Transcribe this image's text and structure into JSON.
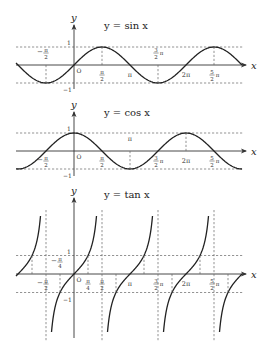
{
  "figure": {
    "width": 272,
    "height": 358,
    "unit_px_per_half_pi": 28,
    "colors": {
      "curve": "#222222",
      "axis": "#333333",
      "dash": "#666666",
      "background": "#ffffff"
    }
  },
  "plots": [
    {
      "id": "sin",
      "title": "y = sin x",
      "function": "sin",
      "origin": {
        "x": 74,
        "y": 65
      },
      "amplitude_px": 18,
      "x_axis": {
        "from": 16,
        "to": 246,
        "label": "x"
      },
      "y_axis": {
        "from": 89,
        "to": 25,
        "label": "y"
      },
      "dash_levels": [
        1,
        -1
      ],
      "y_ticks": [
        {
          "value": 1,
          "label": "1"
        },
        {
          "value": -1,
          "label": "−1"
        }
      ],
      "origin_label": "O",
      "x_ticks": [
        {
          "k": -1,
          "num": "π",
          "den": "2",
          "sign": "−",
          "pos": "above"
        },
        {
          "k": 1,
          "num": "π",
          "den": "2",
          "sign": "",
          "pos": "below"
        },
        {
          "k": 2,
          "text": "π",
          "pos": "below"
        },
        {
          "k": 3,
          "num": "3",
          "den": "2",
          "suffix": "π",
          "pos": "above"
        },
        {
          "k": 4,
          "text": "2π",
          "pos": "below"
        },
        {
          "k": 5,
          "num": "5",
          "den": "2",
          "suffix": "π",
          "pos": "below"
        }
      ],
      "guide_lines_at_k": [
        -1,
        1,
        3,
        5
      ]
    },
    {
      "id": "cos",
      "title": "y = cos x",
      "function": "cos",
      "origin": {
        "x": 74,
        "y": 151
      },
      "amplitude_px": 18,
      "x_axis": {
        "from": 16,
        "to": 246,
        "label": "x"
      },
      "y_axis": {
        "from": 176,
        "to": 112,
        "label": "y"
      },
      "dash_levels": [
        1,
        -1
      ],
      "y_ticks": [
        {
          "value": 1,
          "label": "1"
        },
        {
          "value": -1,
          "label": "−1"
        }
      ],
      "origin_label": "O",
      "x_ticks": [
        {
          "k": -1,
          "num": "π",
          "den": "2",
          "sign": "−",
          "pos": "below"
        },
        {
          "k": 1,
          "num": "π",
          "den": "2",
          "sign": "",
          "pos": "below"
        },
        {
          "k": 2,
          "text": "π",
          "pos": "above"
        },
        {
          "k": 3,
          "num": "3",
          "den": "2",
          "suffix": "π",
          "pos": "below"
        },
        {
          "k": 4,
          "text": "2π",
          "pos": "below"
        },
        {
          "k": 5,
          "num": "5",
          "den": "2",
          "suffix": "π",
          "pos": "below"
        }
      ],
      "guide_lines_at_k": [
        2,
        4
      ]
    },
    {
      "id": "tan",
      "title": "y = tan x",
      "function": "tan",
      "origin": {
        "x": 74,
        "y": 274
      },
      "unit_px": 18.5,
      "x_axis": {
        "from": 16,
        "to": 246,
        "label": "x"
      },
      "y_axis": {
        "from": 338,
        "to": 198,
        "label": "y"
      },
      "clip_y": [
        210,
        338
      ],
      "dash_levels": [
        1,
        -1
      ],
      "y_ticks": [
        {
          "value": 1,
          "label": "1"
        },
        {
          "value": -1,
          "label": "−1"
        }
      ],
      "origin_label": "O",
      "x_ticks": [
        {
          "k": -1,
          "num": "π",
          "den": "2",
          "sign": "−",
          "pos": "below"
        },
        {
          "k": -0.5,
          "num": "π",
          "den": "4",
          "sign": "−",
          "pos": "above"
        },
        {
          "k": 0.5,
          "num": "π",
          "den": "4",
          "sign": "",
          "pos": "below"
        },
        {
          "k": 1,
          "num": "π",
          "den": "2",
          "sign": "",
          "pos": "below"
        },
        {
          "k": 2,
          "text": "π",
          "pos": "below"
        },
        {
          "k": 3,
          "num": "3",
          "den": "2",
          "suffix": "π",
          "pos": "below"
        },
        {
          "k": 4,
          "text": "2π",
          "pos": "below"
        },
        {
          "k": 5,
          "num": "5",
          "den": "2",
          "suffix": "π",
          "pos": "below"
        }
      ],
      "asymptotes_at_k": [
        -1,
        1,
        3,
        5
      ]
    }
  ]
}
